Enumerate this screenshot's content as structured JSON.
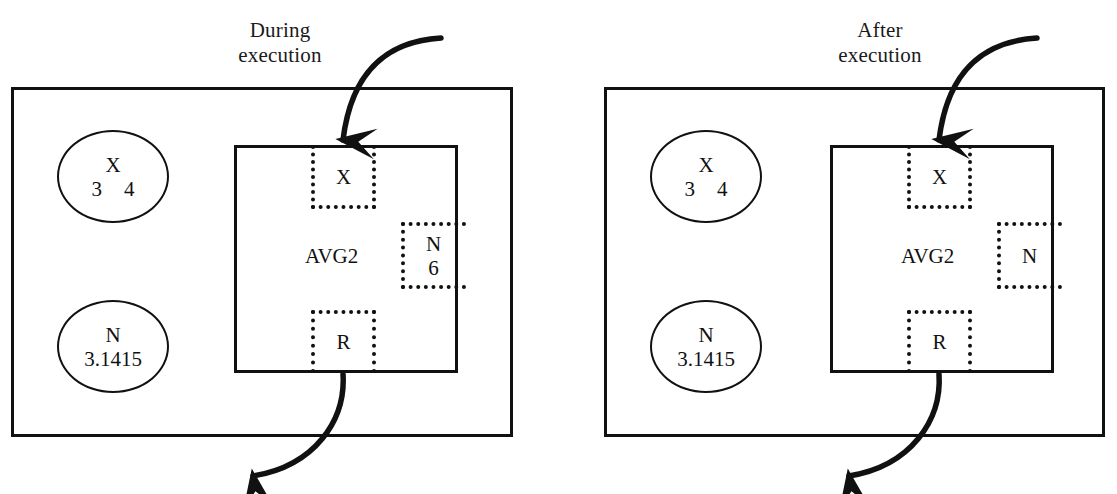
{
  "figure": {
    "width": 1117,
    "height": 494,
    "background": "#ffffff",
    "ink_color": "#111111",
    "top_clipped_caption": ""
  },
  "panels": [
    {
      "id": "during",
      "title": "During\nexecution",
      "outer_box": {
        "x": 11,
        "y": 87,
        "w": 502,
        "h": 350
      },
      "value_cells": [
        {
          "id": "x-value-cell",
          "name": "X",
          "values": [
            "3",
            "4"
          ],
          "x": 57,
          "y": 130,
          "w": 112,
          "h": 93
        },
        {
          "id": "n-value-cell",
          "name": "N",
          "values": [
            "3.1415"
          ],
          "x": 57,
          "y": 300,
          "w": 112,
          "h": 93
        }
      ],
      "procedure": {
        "label": "AVG2",
        "box": {
          "x": 234,
          "y": 145,
          "w": 224,
          "h": 228
        },
        "label_pos": {
          "x": 305,
          "y": 245
        },
        "slots": [
          {
            "id": "slot-x-in",
            "name": "X",
            "value": "",
            "x": 311,
            "y": 145,
            "w": 65,
            "h": 64,
            "open_side": "top"
          },
          {
            "id": "slot-n-ref",
            "name": "N",
            "value": "6",
            "x": 401,
            "y": 222,
            "w": 65,
            "h": 67,
            "open_side": "right"
          },
          {
            "id": "slot-r-out",
            "name": "R",
            "value": "",
            "x": 311,
            "y": 310,
            "w": 65,
            "h": 63,
            "open_side": "bottom"
          }
        ]
      },
      "arrows": [
        {
          "id": "arrow-in",
          "direction": "down-into-x-slot"
        },
        {
          "id": "arrow-out",
          "direction": "down-left-out-of-r-slot"
        }
      ]
    },
    {
      "id": "after",
      "title": "After\nexecution",
      "outer_box": {
        "x": 604,
        "y": 87,
        "w": 501,
        "h": 350
      },
      "value_cells": [
        {
          "id": "x-value-cell",
          "name": "X",
          "values": [
            "3",
            "4"
          ],
          "x": 650,
          "y": 130,
          "w": 112,
          "h": 93
        },
        {
          "id": "n-value-cell",
          "name": "N",
          "values": [
            "3.1415"
          ],
          "x": 650,
          "y": 300,
          "w": 112,
          "h": 93
        }
      ],
      "procedure": {
        "label": "AVG2",
        "box": {
          "x": 830,
          "y": 145,
          "w": 224,
          "h": 228
        },
        "label_pos": {
          "x": 901,
          "y": 245
        },
        "slots": [
          {
            "id": "slot-x-in",
            "name": "X",
            "value": "",
            "x": 907,
            "y": 145,
            "w": 65,
            "h": 64,
            "open_side": "top"
          },
          {
            "id": "slot-n-ref",
            "name": "N",
            "value": "",
            "x": 997,
            "y": 222,
            "w": 65,
            "h": 67,
            "open_side": "right"
          },
          {
            "id": "slot-r-out",
            "name": "R",
            "value": "",
            "x": 907,
            "y": 310,
            "w": 65,
            "h": 63,
            "open_side": "bottom"
          }
        ]
      },
      "arrows": [
        {
          "id": "arrow-in",
          "direction": "down-into-x-slot"
        },
        {
          "id": "arrow-out",
          "direction": "down-left-out-of-r-slot"
        }
      ]
    }
  ]
}
